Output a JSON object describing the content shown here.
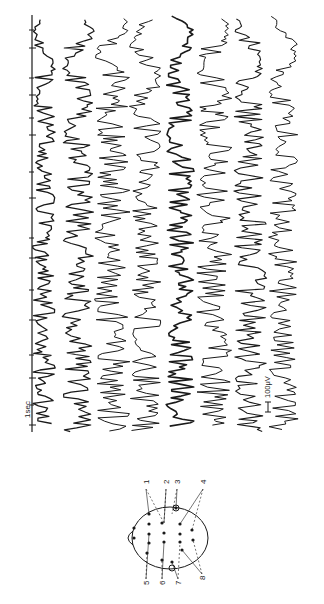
{
  "figure": {
    "type": "EEG recording figure (rotated 90°)",
    "time_scale_label": "1sec",
    "amplitude_scale_label": "100μV",
    "ink_color": "#1a1a1a",
    "background": "#ffffff"
  },
  "time_marker": {
    "x": 32,
    "y_start": 15,
    "y_end": 432,
    "tick_positions_y": [
      30,
      48,
      78,
      95,
      118,
      135,
      172,
      198,
      238,
      258,
      290,
      320,
      355,
      378,
      405,
      425
    ]
  },
  "traces": [
    {
      "id": 1,
      "x": 44,
      "amp": 9,
      "thick": 1.3,
      "seed": 11
    },
    {
      "id": 2,
      "x": 78,
      "amp": 13,
      "thick": 1.2,
      "seed": 23
    },
    {
      "id": 3,
      "x": 112,
      "amp": 14,
      "thick": 1.0,
      "seed": 37
    },
    {
      "id": 4,
      "x": 146,
      "amp": 13,
      "thick": 1.0,
      "seed": 41
    },
    {
      "id": 5,
      "x": 180,
      "amp": 11,
      "thick": 1.6,
      "seed": 53
    },
    {
      "id": 6,
      "x": 214,
      "amp": 14,
      "thick": 1.0,
      "seed": 67
    },
    {
      "id": 7,
      "x": 250,
      "amp": 13,
      "thick": 1.1,
      "seed": 79
    },
    {
      "id": 8,
      "x": 284,
      "amp": 12,
      "thick": 1.0,
      "seed": 83
    }
  ],
  "head_diagram": {
    "center_x": 170,
    "center_y": 538,
    "radius_x": 38,
    "radius_y": 31,
    "labels_top": [
      {
        "text": "1",
        "x": 146,
        "y": 484
      },
      {
        "text": "2",
        "x": 166,
        "y": 484
      },
      {
        "text": "3",
        "x": 177,
        "y": 484
      },
      {
        "text": "4",
        "x": 203,
        "y": 484
      }
    ],
    "labels_bottom": [
      {
        "text": "5",
        "x": 146,
        "y": 585
      },
      {
        "text": "6",
        "x": 162,
        "y": 585
      },
      {
        "text": "7",
        "x": 178,
        "y": 585
      },
      {
        "text": "8",
        "x": 202,
        "y": 580
      }
    ],
    "electrodes": [
      [
        134,
        528
      ],
      [
        134,
        538
      ],
      [
        149,
        514
      ],
      [
        149,
        524
      ],
      [
        149,
        534
      ],
      [
        149,
        543
      ],
      [
        147,
        553
      ],
      [
        162,
        523
      ],
      [
        164,
        533
      ],
      [
        164,
        542
      ],
      [
        162,
        560
      ],
      [
        180,
        524
      ],
      [
        180,
        534
      ],
      [
        180,
        542
      ],
      [
        182,
        550
      ],
      [
        192,
        530
      ],
      [
        193,
        540
      ],
      [
        176,
        508
      ],
      [
        172,
        562
      ]
    ]
  }
}
